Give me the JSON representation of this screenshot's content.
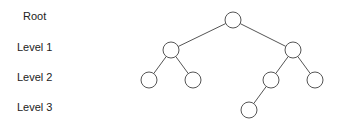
{
  "labels": {
    "root": "Root",
    "level1": "Level 1",
    "level2": "Level 2",
    "level3": "Level 3"
  },
  "tree": {
    "node_radius": 8,
    "stroke_color": "#555555",
    "nodes": [
      {
        "id": "root",
        "level": 0,
        "x": 233,
        "y": 20
      },
      {
        "id": "l1-left",
        "level": 1,
        "x": 171,
        "y": 50
      },
      {
        "id": "l1-right",
        "level": 1,
        "x": 293,
        "y": 50
      },
      {
        "id": "l2-a",
        "level": 2,
        "x": 149,
        "y": 80
      },
      {
        "id": "l2-b",
        "level": 2,
        "x": 193,
        "y": 80
      },
      {
        "id": "l2-c",
        "level": 2,
        "x": 271,
        "y": 80
      },
      {
        "id": "l2-d",
        "level": 2,
        "x": 315,
        "y": 80
      },
      {
        "id": "l3-a",
        "level": 3,
        "x": 249,
        "y": 110
      }
    ],
    "edges": [
      [
        "root",
        "l1-left"
      ],
      [
        "root",
        "l1-right"
      ],
      [
        "l1-left",
        "l2-a"
      ],
      [
        "l1-left",
        "l2-b"
      ],
      [
        "l1-right",
        "l2-c"
      ],
      [
        "l1-right",
        "l2-d"
      ],
      [
        "l2-c",
        "l3-a"
      ]
    ]
  }
}
